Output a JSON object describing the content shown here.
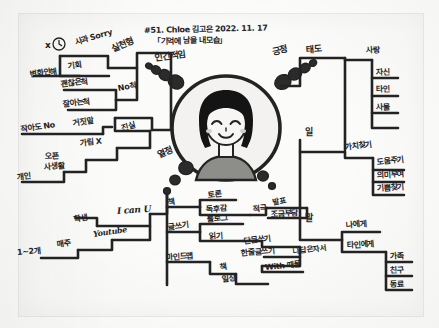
{
  "document": {
    "kind": "handwritten-mindmap-photo",
    "header_line1": "#51. Chloe 김고은 2022. 11. 17",
    "header_line2": "「기억에 남을 내모습」",
    "center_label": "인간적임",
    "ink_color": "#232323",
    "paper_color": "#fbfbfa"
  },
  "bubble_labels": {
    "upper_right": "긍정",
    "lower_left": "열정"
  },
  "branches": {
    "top_left": {
      "name": "실천형",
      "nodes": [
        {
          "label": "사과 Sorry",
          "id": "apology"
        },
        {
          "label": "x",
          "id": "x-mark",
          "icon": "clock-icon"
        },
        {
          "label": "기회",
          "id": "chance"
        },
        {
          "label": "변화안해",
          "id": "no-change"
        },
        {
          "label": "No척",
          "id": "no-pretend"
        },
        {
          "label": "괜찮은척",
          "id": "pretend-ok"
        },
        {
          "label": "잘아는척",
          "id": "pretend-know"
        }
      ]
    },
    "left_lower": {
      "name": "진실",
      "nodes": [
        {
          "label": "거짓말",
          "id": "lie"
        },
        {
          "label": "작아도 No",
          "id": "small-no"
        },
        {
          "label": "가림 X",
          "id": "no-hiding"
        },
        {
          "label": "오픈",
          "id": "open"
        },
        {
          "label": "사생활",
          "id": "private-life"
        },
        {
          "label": "개인",
          "id": "personal"
        }
      ]
    },
    "bottom_left": {
      "nodes": [
        {
          "label": "I can U",
          "id": "i-can-u"
        },
        {
          "label": "학생",
          "id": "student"
        },
        {
          "label": "Youtube",
          "id": "youtube"
        },
        {
          "label": "매주",
          "id": "weekly"
        },
        {
          "label": "1~2개",
          "id": "one-two"
        }
      ]
    },
    "bottom_center": {
      "name": "책",
      "nodes": [
        {
          "label": "토론",
          "id": "debate"
        },
        {
          "label": "독후감",
          "id": "book-report"
        },
        {
          "label": "적극",
          "id": "active"
        },
        {
          "label": "글쓰기",
          "id": "writing"
        },
        {
          "label": "블로그",
          "id": "blog"
        },
        {
          "label": "읽기",
          "id": "reading"
        },
        {
          "label": "마인드맵",
          "id": "mindmap"
        },
        {
          "label": "책",
          "id": "book2"
        },
        {
          "label": "일상",
          "id": "daily"
        }
      ]
    },
    "bottom_right": {
      "nodes": [
        {
          "label": "발표",
          "id": "presentation"
        },
        {
          "label": "조금부담",
          "id": "slight-burden"
        },
        {
          "label": "단문쓰기",
          "id": "short-writing"
        },
        {
          "label": "한줄글쓰기",
          "id": "one-line-writing"
        },
        {
          "label": "나답은자서",
          "id": "my-own-memoir"
        },
        {
          "label": "With 때믈",
          "id": "with-them"
        }
      ]
    },
    "right_top": {
      "name": "태도",
      "nodes": [
        {
          "label": "사랑",
          "id": "love"
        },
        {
          "label": "자신",
          "id": "self"
        },
        {
          "label": "타인",
          "id": "other"
        },
        {
          "label": "사물",
          "id": "things"
        }
      ]
    },
    "right_mid": {
      "name": "일",
      "nodes": [
        {
          "label": "가치찾기",
          "id": "find-value"
        },
        {
          "label": "도움주기",
          "id": "give-help"
        },
        {
          "label": "의미부여",
          "id": "give-meaning"
        },
        {
          "label": "기쁨찾기",
          "id": "find-joy"
        }
      ]
    },
    "right_bottom": {
      "name": "말",
      "nodes": [
        {
          "label": "나에게",
          "id": "to-me"
        },
        {
          "label": "타인에게",
          "id": "to-others"
        },
        {
          "label": "가족",
          "id": "family"
        },
        {
          "label": "친구",
          "id": "friend"
        },
        {
          "label": "동료",
          "id": "colleague"
        }
      ]
    }
  }
}
